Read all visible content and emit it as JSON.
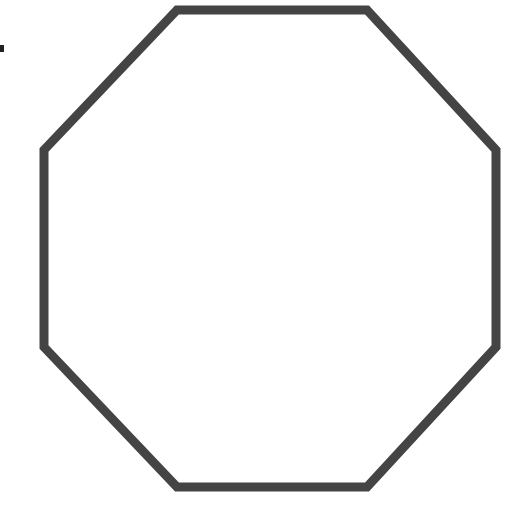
{
  "diagram": {
    "shape": "octagon",
    "stroke_color": "#444444",
    "fill_color": "#ffffff",
    "stroke_width": 9,
    "points": "177,10 367,10 496,150 496,347 367,487 177,487 44,347 44,150"
  },
  "edge_mark": {
    "color": "#222222"
  }
}
